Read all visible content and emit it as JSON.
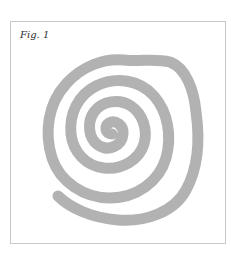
{
  "figure": {
    "label": "Fig. 1",
    "colors": {
      "stroke": "#b2b2b2",
      "frame": "#c8c8c8",
      "background": "#ffffff"
    }
  }
}
